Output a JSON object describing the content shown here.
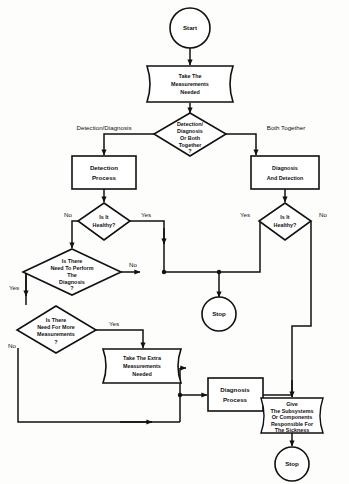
{
  "diagram": {
    "type": "flowchart",
    "colors": {
      "stroke": "#111111",
      "fill": "#ffffff",
      "background": "#fdfdfb"
    },
    "nodes": [
      {
        "id": "start",
        "shape": "circle",
        "label": "Start"
      },
      {
        "id": "take_meas",
        "shape": "drum",
        "lines": [
          "Take The",
          "Measurements",
          "Needed"
        ]
      },
      {
        "id": "det_diag",
        "shape": "diamond",
        "lines": [
          "Detection/",
          "Diagnosis",
          "Or Both",
          "Together",
          "?"
        ]
      },
      {
        "id": "det_proc",
        "shape": "rect",
        "lines": [
          "Detection",
          "Process"
        ]
      },
      {
        "id": "diag_det",
        "shape": "rect",
        "lines": [
          "Diagnosis",
          "And Detection"
        ]
      },
      {
        "id": "healthy_l",
        "shape": "diamond",
        "lines": [
          "Is It",
          "Healthy?"
        ]
      },
      {
        "id": "healthy_r",
        "shape": "diamond",
        "lines": [
          "Is It",
          "Healthy?"
        ]
      },
      {
        "id": "need_diag",
        "shape": "diamond",
        "lines": [
          "Is There",
          "Need To Perform",
          "The",
          "Diagnosis",
          "?"
        ]
      },
      {
        "id": "need_more",
        "shape": "diamond",
        "lines": [
          "Is There",
          "Need For More",
          "Measurements",
          "?"
        ]
      },
      {
        "id": "extra_meas",
        "shape": "drum",
        "lines": [
          "Take The Extra",
          "Measurements",
          "Needed"
        ]
      },
      {
        "id": "diag_proc",
        "shape": "rect",
        "lines": [
          "Diagnosis",
          "Process"
        ]
      },
      {
        "id": "give_sub",
        "shape": "drum",
        "lines": [
          "Give",
          "The Subsystems",
          "Or Components",
          "Responsible For",
          "The Sickness"
        ]
      },
      {
        "id": "stop_mid",
        "shape": "circle",
        "label": "Stop"
      },
      {
        "id": "stop_bottom",
        "shape": "circle",
        "label": "Stop"
      }
    ],
    "labels": {
      "start": "Start",
      "take_measurements": [
        "Take The",
        "Measurements",
        "Needed"
      ],
      "detection_diagnosis_decision": [
        "Detection/",
        "Diagnosis",
        "Or Both",
        "Together",
        "?"
      ],
      "detection_process": [
        "Detection",
        "Process"
      ],
      "diagnosis_and_detection": [
        "Diagnosis",
        "And Detection"
      ],
      "is_it_healthy_left": [
        "Is It",
        "Healthy?"
      ],
      "is_it_healthy_right": [
        "Is It",
        "Healthy?"
      ],
      "need_to_perform_diagnosis": [
        "Is There",
        "Need To Perform",
        "The",
        "Diagnosis",
        "?"
      ],
      "need_for_more_measurements": [
        "Is There",
        "Need For More",
        "Measurements",
        "?"
      ],
      "take_extra_measurements": [
        "Take The Extra",
        "Measurements",
        "Needed"
      ],
      "diagnosis_process": [
        "Diagnosis",
        "Process"
      ],
      "give_subsystems": [
        "Give",
        "The Subsystems",
        "Or Components",
        "Responsible For",
        "The Sickness"
      ],
      "stop_middle": "Stop",
      "stop_bottom": "Stop"
    },
    "edge_labels": {
      "detection_diagnosis_branch": "Detection/Diagnosis",
      "both_together_branch": "Both Together",
      "healthy_left_no": "No",
      "healthy_left_yes": "Yes",
      "healthy_right_yes": "Yes",
      "healthy_right_no": "No",
      "need_diag_yes": "Yes",
      "need_diag_no": "No",
      "need_more_yes": "Yes",
      "need_more_no": "No"
    }
  }
}
